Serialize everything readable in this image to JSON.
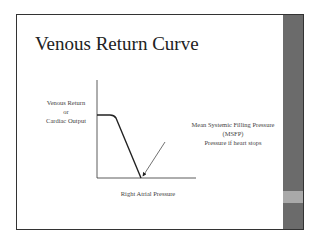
{
  "slide": {
    "title": "Venous Return Curve",
    "y_axis_label": {
      "line1": "Venous Return",
      "line2": "or",
      "line3": "Cardiac Output"
    },
    "x_axis_label": "Right Atrial Pressure",
    "annotation": {
      "line1": "Mean Systemic Filling Pressure",
      "line2": "(MSFP)",
      "line3": "Pressure  if heart stops"
    }
  },
  "colors": {
    "sidebar": "#6b6b6b",
    "sidebar_band": "#a9a9a9",
    "line": "#222222"
  }
}
